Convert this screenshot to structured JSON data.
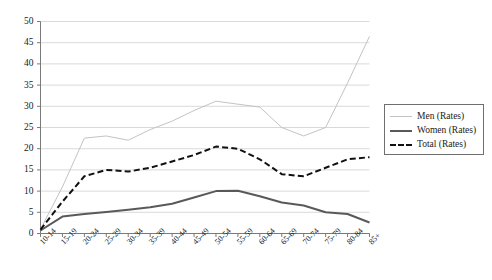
{
  "chart_data": {
    "type": "line",
    "title": "",
    "subtitle": "",
    "xlabel": "",
    "ylabel": "",
    "ylim": [
      0,
      50
    ],
    "ytick_step": 5,
    "yticks": [
      50,
      45,
      40,
      35,
      30,
      25,
      20,
      15,
      10,
      5,
      0
    ],
    "grid": true,
    "grid_axis": "y",
    "legend_position": "right",
    "categories": [
      "10-14",
      "15-19",
      "20-24",
      "25-29",
      "30-34",
      "35-39",
      "40-44",
      "45-49",
      "50-54",
      "55-59",
      "60-64",
      "65-69",
      "70-74",
      "75-79",
      "80-84",
      "85+"
    ],
    "series": [
      {
        "name": "Men (Rates)",
        "color": "#c3c3c3",
        "style": "solid",
        "width": 1,
        "values": [
          1.0,
          11.0,
          22.5,
          23.0,
          22.0,
          24.5,
          26.5,
          29.0,
          31.2,
          30.5,
          29.8,
          25.0,
          23.0,
          25.0,
          35.5,
          46.5
        ]
      },
      {
        "name": "Women (Rates)",
        "color": "#595959",
        "style": "solid",
        "width": 2,
        "values": [
          0.7,
          4.0,
          4.6,
          5.1,
          5.6,
          6.2,
          7.0,
          8.5,
          10.0,
          10.1,
          8.8,
          7.3,
          6.6,
          5.0,
          4.6,
          2.6
        ]
      },
      {
        "name": "Total (Rates)",
        "color": "#111111",
        "style": "dashed",
        "width": 2,
        "values": [
          0.9,
          7.5,
          13.5,
          15.0,
          14.6,
          15.5,
          17.0,
          18.5,
          20.5,
          20.0,
          17.5,
          14.0,
          13.5,
          15.5,
          17.5,
          18.0
        ]
      }
    ]
  },
  "legend": {
    "items": [
      {
        "label": "Men (Rates)",
        "swatch": "men-line-swatch"
      },
      {
        "label": "Women (Rates)",
        "swatch": "women-line-swatch"
      },
      {
        "label": "Total (Rates)",
        "swatch": "total-line-swatch"
      }
    ]
  },
  "axes": {
    "y_tick_labels": [
      "50",
      "45",
      "40",
      "35",
      "30",
      "25",
      "20",
      "15",
      "10",
      "5",
      "0"
    ],
    "x_tick_labels": [
      "10-14",
      "15-19",
      "20-24",
      "25-29",
      "30-34",
      "35-39",
      "40-44",
      "45-49",
      "50-54",
      "55-59",
      "60-64",
      "65-69",
      "70-74",
      "75-79",
      "80-84",
      "85+"
    ]
  }
}
